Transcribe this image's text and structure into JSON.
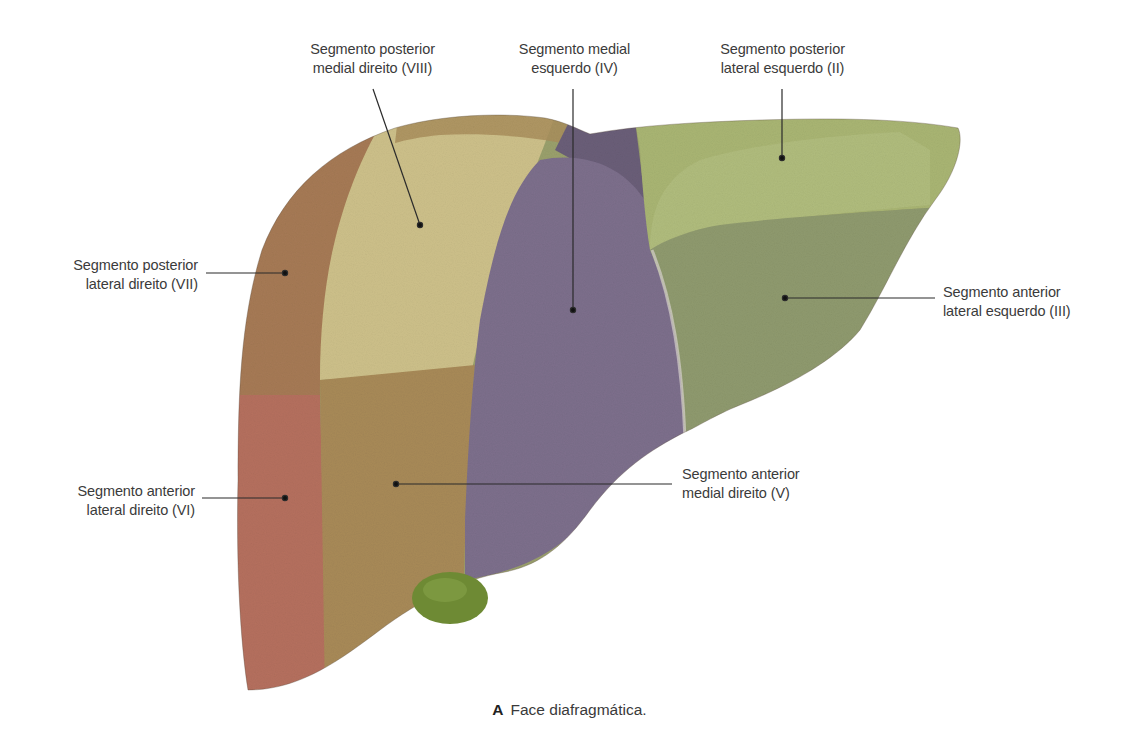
{
  "figure": {
    "caption_letter": "A",
    "caption_text": "Face diafragmática.",
    "colors": {
      "segment_VII": "#a67a55",
      "segment_VIII": "#cdc08a",
      "segment_VI": "#b5705e",
      "segment_V": "#a88a58",
      "segment_IV": "#7d6f8c",
      "segment_IV_upper": "#6a5e78",
      "segment_II": "#a9b573",
      "segment_III": "#8f9a6e",
      "gallbladder": "#6e8a34",
      "leader_line": "#2b2b2b",
      "label_text": "#3b3b3b"
    }
  },
  "labels": {
    "viii": {
      "line1": "Segmento posterior",
      "line2": "medial direito (VIII)"
    },
    "iv": {
      "line1": "Segmento medial",
      "line2": "esquerdo (IV)"
    },
    "ii": {
      "line1": "Segmento posterior",
      "line2": "lateral esquerdo (II)"
    },
    "vii": {
      "line1": "Segmento posterior",
      "line2": "lateral direito (VII)"
    },
    "iii": {
      "line1": "Segmento anterior",
      "line2": "lateral esquerdo (III)"
    },
    "vi": {
      "line1": "Segmento anterior",
      "line2": "lateral direito (VI)"
    },
    "v": {
      "line1": "Segmento anterior",
      "line2": "medial direito (V)"
    }
  }
}
